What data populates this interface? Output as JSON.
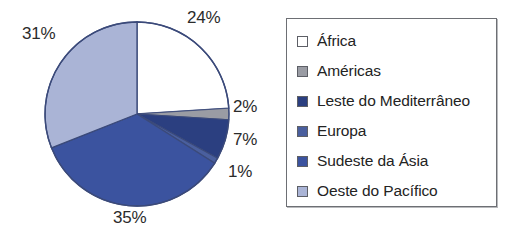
{
  "chart_data": {
    "type": "pie",
    "title": "",
    "labels": [
      "África",
      "Américas",
      "Leste do Mediterrâneo",
      "Europa",
      "Sudeste da Ásia",
      "Oeste do Pacífico"
    ],
    "values": [
      24,
      2,
      7,
      1,
      35,
      31
    ],
    "value_labels": [
      "24%",
      "2%",
      "7%",
      "1%",
      "35%",
      "31%"
    ],
    "units": "percent",
    "start_angle_deg": 0,
    "direction": "clockwise",
    "legend": {
      "position": "right",
      "border_color": "#6d6f74",
      "entries": [
        {
          "label": "África",
          "color": "#ffffff",
          "value_label": "24%"
        },
        {
          "label": "Américas",
          "color": "#9a9ca4",
          "value_label": "2%"
        },
        {
          "label": "Leste do Mediterrâneo",
          "color": "#2b3f80",
          "value_label": "7%"
        },
        {
          "label": "Europa",
          "color": "#4a5f9e",
          "value_label": "1%"
        },
        {
          "label": "Sudeste da Ásia",
          "color": "#3b539f",
          "value_label": "35%"
        },
        {
          "label": "Oeste do Pacífico",
          "color": "#aab4d6",
          "value_label": "31%"
        }
      ]
    },
    "colors": [
      "#ffffff",
      "#9a9ca4",
      "#2b3f80",
      "#4a5f9e",
      "#3b539f",
      "#aab4d6"
    ],
    "slice_outline_color": "#3b4a7a",
    "label_text_color": "#2b2b2b"
  },
  "pie": {
    "center_x": 137,
    "center_y": 114,
    "radius": 92,
    "labels": {
      "africa": "24%",
      "americas": "2%",
      "mediterraneo": "7%",
      "europa": "1%",
      "asia": "35%",
      "pacifico": "31%"
    }
  },
  "legend": {
    "items": [
      {
        "label": "África"
      },
      {
        "label": "Américas"
      },
      {
        "label": "Leste do Mediterrâneo"
      },
      {
        "label": "Europa"
      },
      {
        "label": "Sudeste da Ásia"
      },
      {
        "label": "Oeste do Pacífico"
      }
    ]
  }
}
